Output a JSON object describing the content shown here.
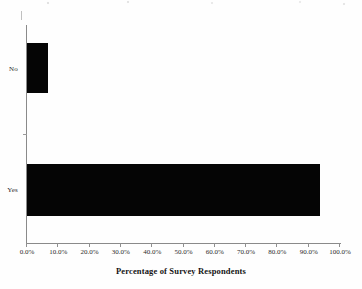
{
  "figure": {
    "background_color": "#fefefe",
    "bar_color": "#050505",
    "axis_color": "#8a8a8a",
    "text_color": "#2b2b2b",
    "scan_artifact": true
  },
  "chart_data": {
    "type": "bar",
    "orientation": "horizontal",
    "title": "",
    "xlabel": "Percentage of Survey Respondents",
    "ylabel": "",
    "categories": [
      "Yes",
      "No"
    ],
    "values": [
      93.5,
      6.7
    ],
    "value_unit": "%",
    "xlim": [
      0,
      100
    ],
    "xticks": [
      0,
      10,
      20,
      30,
      40,
      50,
      60,
      70,
      80,
      90,
      100
    ],
    "xticklabels": [
      "0.0%",
      "10.0%",
      "20.0%",
      "30.0%",
      "40.0%",
      "50.0%",
      "60.0%",
      "70.0%",
      "80.0%",
      "90.0%",
      "100.0%"
    ],
    "grid": false,
    "legend": false,
    "series": [
      {
        "name": "Percentage of Survey Respondents",
        "values": [
          93.5,
          6.7
        ]
      }
    ],
    "bars": [
      {
        "category": "No",
        "value": 6.7,
        "label": "6.7%"
      },
      {
        "category": "Yes",
        "value": 93.5,
        "label": "93.5%"
      }
    ]
  }
}
